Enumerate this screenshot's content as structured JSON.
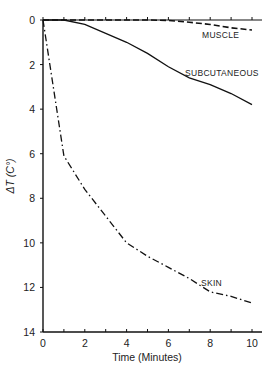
{
  "chart_data": {
    "type": "line",
    "title": "",
    "xlabel": "Time (Minutes)",
    "ylabel": "ΔT (C°)",
    "xlim": [
      0,
      10
    ],
    "ylim": [
      0,
      14
    ],
    "y_inverted": true,
    "grid": false,
    "legend": "inline labels",
    "x_ticks": [
      0,
      2,
      4,
      6,
      8,
      10
    ],
    "y_ticks": [
      0,
      2,
      4,
      6,
      8,
      10,
      12,
      14
    ],
    "x": [
      0,
      1,
      2,
      3,
      4,
      5,
      6,
      7,
      8,
      9,
      10
    ],
    "series": [
      {
        "name": "MUSCLE",
        "style": "dashed",
        "values": [
          0,
          0,
          0,
          0,
          0,
          0,
          0.02,
          0.1,
          0.2,
          0.35,
          0.45
        ]
      },
      {
        "name": "SUBCUTANEOUS",
        "style": "solid",
        "values": [
          0,
          0,
          0.2,
          0.6,
          1.0,
          1.5,
          2.1,
          2.6,
          2.9,
          3.3,
          3.8
        ]
      },
      {
        "name": "SKIN",
        "style": "dash-dot",
        "values": [
          0,
          6.1,
          7.6,
          8.8,
          10.0,
          10.6,
          11.1,
          11.6,
          12.2,
          12.4,
          12.7
        ]
      }
    ]
  }
}
